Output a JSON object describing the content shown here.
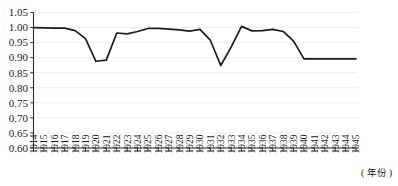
{
  "chart_data": {
    "type": "line",
    "title": "",
    "subtitle": "",
    "xlabel": "( 年份 )",
    "ylabel": "",
    "xlim": [
      1914,
      1945
    ],
    "ylim": [
      0.6,
      1.05
    ],
    "grid": true,
    "legend": null,
    "legend_position": "none",
    "x": [
      1914,
      1915,
      1916,
      1917,
      1918,
      1919,
      1920,
      1921,
      1922,
      1923,
      1924,
      1925,
      1926,
      1927,
      1928,
      1929,
      1930,
      1931,
      1932,
      1933,
      1934,
      1935,
      1936,
      1937,
      1938,
      1939,
      1940,
      1941,
      1942,
      1943,
      1944,
      1945
    ],
    "categories": [
      "1914",
      "1915",
      "1916",
      "1917",
      "1918",
      "1919",
      "1920",
      "1921",
      "1922",
      "1923",
      "1924",
      "1925",
      "1926",
      "1927",
      "1928",
      "1929",
      "1930",
      "1931",
      "1932",
      "1933",
      "1934",
      "1935",
      "1936",
      "1937",
      "1938",
      "1939",
      "1940",
      "1941",
      "1942",
      "1943",
      "1944",
      "1945"
    ],
    "series": [
      {
        "name": "",
        "values": [
          1.0,
          0.999,
          0.998,
          0.998,
          0.99,
          0.963,
          0.888,
          0.892,
          0.982,
          0.979,
          0.987,
          0.997,
          0.997,
          0.995,
          0.992,
          0.988,
          0.994,
          0.958,
          0.874,
          0.935,
          1.004,
          0.989,
          0.99,
          0.994,
          0.987,
          0.955,
          0.896,
          0.896,
          0.896,
          0.896,
          0.896,
          0.896
        ]
      }
    ],
    "yticks": [
      0.6,
      0.65,
      0.7,
      0.75,
      0.8,
      0.85,
      0.9,
      0.95,
      1.0,
      1.05
    ],
    "ytick_labels": [
      "0.60",
      "0.65",
      "0.70",
      "0.75",
      "0.80",
      "0.85",
      "0.90",
      "0.95",
      "1.00",
      "1.05"
    ],
    "xtick_labels": [
      "1914",
      "1915",
      "1916",
      "1917",
      "1918",
      "1919",
      "1920",
      "1921",
      "1922",
      "1923",
      "1924",
      "1925",
      "1926",
      "1927",
      "1928",
      "1929",
      "1930",
      "1931",
      "1932",
      "1933",
      "1934",
      "1935",
      "1936",
      "1937",
      "1938",
      "1939",
      "1940",
      "1941",
      "1942",
      "1943",
      "1944",
      "1945"
    ],
    "annotations": [],
    "colors": {
      "line": "#1c1c1c",
      "grid": "#e9e9e9",
      "axis": "#2b2b2b",
      "text": "#1a1a1a",
      "background": "#ffffff"
    }
  }
}
